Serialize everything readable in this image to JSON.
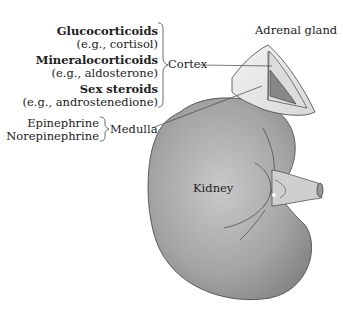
{
  "labels": {
    "adrenal_gland": "Adrenal gland",
    "cortex": "Cortex",
    "medulla": "Medulla",
    "kidney": "Kidney"
  },
  "cortex_hormones": [
    {
      "name": "Glucocorticoids",
      "example": "(e.g., cortisol)"
    },
    {
      "name": "Mineralocorticoids",
      "example": "(e.g., aldosterone)"
    },
    {
      "name": "Sex steroids",
      "example": "(e.g., androstenedione)"
    }
  ],
  "medulla_hormones": [
    "Epinephrine",
    "Norepinephrine"
  ]
}
